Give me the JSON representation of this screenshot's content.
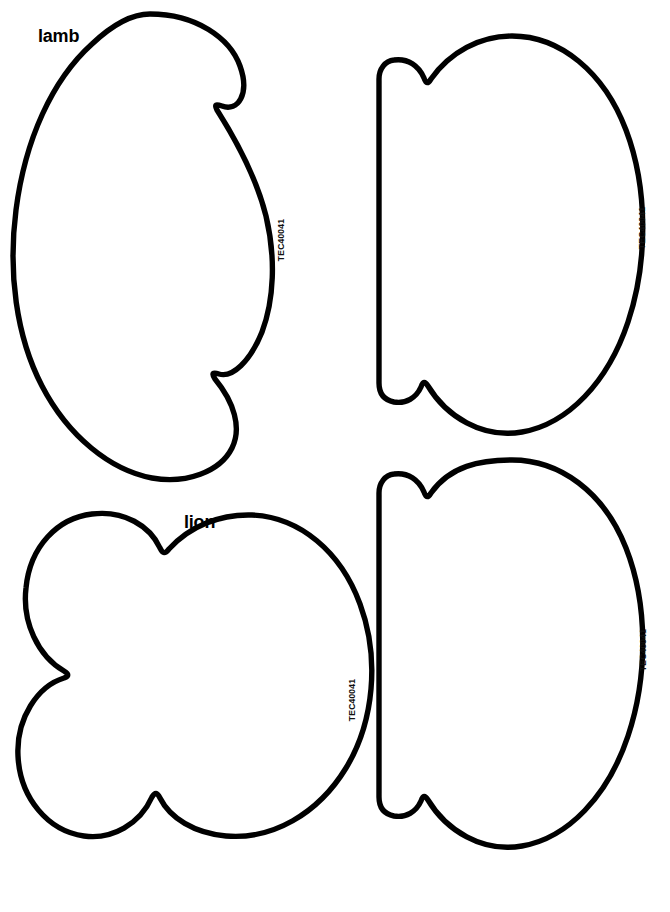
{
  "page": {
    "background_color": "#ffffff",
    "outline_color": "#000000",
    "width": 670,
    "height": 912
  },
  "labels": {
    "lamb": "lamb",
    "lion": "lion"
  },
  "codes": {
    "lamb_front": "TEC40041",
    "lamb_back": "TEC40041",
    "lion_front": "TEC40041",
    "lion_back": "TEC40041"
  },
  "shapes": [
    {
      "id": "lamb-front",
      "name": "lamb-head-pattern-piece",
      "label": "lamb",
      "code": "TEC40041",
      "position": "top-left"
    },
    {
      "id": "lamb-back",
      "name": "lamb-backing-pattern-piece",
      "label": "",
      "code": "TEC40041",
      "position": "top-right"
    },
    {
      "id": "lion-front",
      "name": "lion-head-pattern-piece",
      "label": "lion",
      "code": "TEC40041",
      "position": "bottom-left"
    },
    {
      "id": "lion-back",
      "name": "lion-backing-pattern-piece",
      "label": "",
      "code": "TEC40041",
      "position": "bottom-right"
    }
  ]
}
